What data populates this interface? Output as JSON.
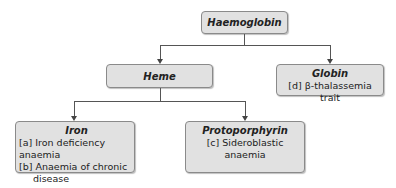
{
  "diagram": {
    "root": {
      "title": "Haemoglobin"
    },
    "level1": [
      {
        "title": "Heme",
        "items": []
      },
      {
        "title": "Globin",
        "items": [
          "[d] β-thalassemia trait"
        ]
      }
    ],
    "level2": [
      {
        "title": "Iron",
        "items": [
          "[a] Iron deficiency anaemia",
          "[b] Anaemia of chronic",
          "disease"
        ]
      },
      {
        "title": "Protoporphyrin",
        "items": [
          "[c] Sideroblastic anaemia"
        ]
      }
    ]
  }
}
